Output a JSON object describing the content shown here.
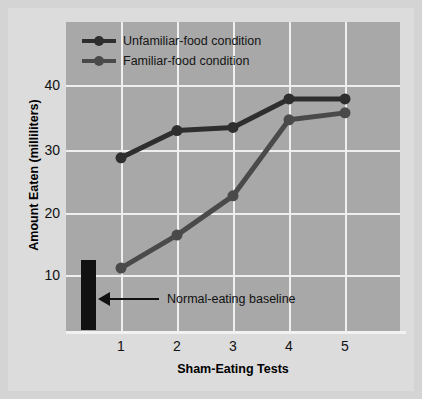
{
  "chart_data": {
    "type": "line",
    "title": "",
    "xlabel": "Sham-Eating Tests",
    "ylabel": "Amount Eaten (milliliters)",
    "x": [
      1,
      2,
      3,
      4,
      5
    ],
    "xticklabels": [
      "1",
      "2",
      "3",
      "4",
      "5"
    ],
    "yticks": [
      10,
      20,
      30,
      40
    ],
    "yticklabels": [
      "10",
      "20",
      "30",
      "40"
    ],
    "ylim": [
      3,
      44
    ],
    "xlim": [
      0.1,
      5.6
    ],
    "grid": "both-axes-white-on-gray",
    "legend_position": "top-left-inside",
    "series": [
      {
        "name": "Unfamiliar-food condition",
        "color": "#2e2e2e",
        "marker": "circle",
        "values": [
          28.5,
          32.8,
          33.3,
          37.8,
          37.8
        ]
      },
      {
        "name": "Familiar-food condition",
        "color": "#4a4a4a",
        "marker": "circle",
        "values": [
          11.1,
          16.3,
          22.5,
          34.5,
          35.6
        ]
      }
    ],
    "annotations": [
      {
        "name": "normal-eating-baseline",
        "label": "Normal-eating baseline",
        "type": "bar-with-arrow",
        "bar_value_range": [
          3.2,
          14.0
        ],
        "bar_x": 0.45,
        "color": "#111111"
      }
    ]
  },
  "legend": {
    "items": [
      {
        "label": "Unfamiliar-food condition"
      },
      {
        "label": "Familiar-food condition"
      }
    ]
  },
  "axes": {
    "y_title": "Amount Eaten (milliliters)",
    "x_title": "Sham-Eating Tests",
    "y_tick_labels": [
      "40",
      "30",
      "20",
      "10"
    ],
    "x_tick_labels": [
      "1",
      "2",
      "3",
      "4",
      "5"
    ]
  },
  "annotation": {
    "label": "Normal-eating baseline"
  },
  "colors": {
    "panel_background": "#a8a8a8",
    "figure_background": "#dcdcdc",
    "page_background": "#d4d4d4",
    "gridline": "#efefef",
    "series_unfamiliar": "#2e2e2e",
    "series_familiar": "#4a4a4a",
    "baseline_bar": "#111111",
    "text": "#111111"
  }
}
